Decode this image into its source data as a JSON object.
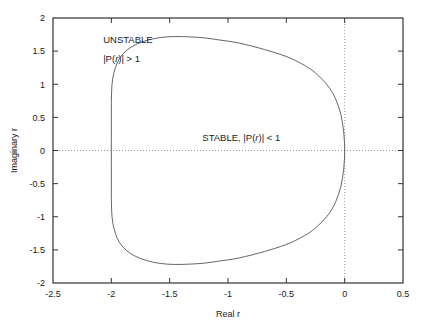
{
  "chart_data": {
    "type": "line",
    "title": "",
    "subtitle": "",
    "xlabel": "Real r",
    "ylabel": "Imaginary r",
    "xlim": [
      -2.5,
      0.5
    ],
    "ylim": [
      -2,
      2
    ],
    "xticks": [
      "-2.5",
      "-2",
      "-1.5",
      "-1",
      "-0.5",
      "0",
      "0.5"
    ],
    "xtick_values": [
      -2.5,
      -2,
      -1.5,
      -1,
      -0.5,
      0,
      0.5
    ],
    "yticks": [
      "-2",
      "-1.5",
      "-1",
      "-0.5",
      "0",
      "0.5",
      "1",
      "1.5",
      "2"
    ],
    "ytick_values": [
      -2,
      -1.5,
      -1,
      -0.5,
      0,
      0.5,
      1,
      1.5,
      2
    ],
    "grid": false,
    "legend": "none",
    "reference_lines": [
      {
        "name": "zero-imaginary-line",
        "orientation": "horizontal",
        "value": 0,
        "style": "dotted"
      },
      {
        "name": "zero-real-line",
        "orientation": "vertical",
        "value": 0,
        "style": "dotted"
      }
    ],
    "series": [
      {
        "name": "stability-boundary",
        "closed": true,
        "style": "solid",
        "color": "#555555",
        "description": "Closed contour where |P(r)| = 1",
        "extrema": {
          "left_real": -2.0,
          "right_real": 0.0,
          "top_imaginary": 1.72,
          "bottom_imaginary": -1.72
        },
        "points": [
          [
            0.0,
            0.0
          ],
          [
            -0.002,
            0.14
          ],
          [
            -0.008,
            0.28
          ],
          [
            -0.018,
            0.41
          ],
          [
            -0.032,
            0.54
          ],
          [
            -0.052,
            0.66
          ],
          [
            -0.078,
            0.78
          ],
          [
            -0.11,
            0.89
          ],
          [
            -0.15,
            0.99
          ],
          [
            -0.197,
            1.08
          ],
          [
            -0.25,
            1.17
          ],
          [
            -0.31,
            1.25
          ],
          [
            -0.38,
            1.32
          ],
          [
            -0.46,
            1.39
          ],
          [
            -0.55,
            1.45
          ],
          [
            -0.64,
            1.5
          ],
          [
            -0.74,
            1.55
          ],
          [
            -0.85,
            1.6
          ],
          [
            -0.96,
            1.64
          ],
          [
            -1.08,
            1.67
          ],
          [
            -1.2,
            1.7
          ],
          [
            -1.33,
            1.715
          ],
          [
            -1.46,
            1.72
          ],
          [
            -1.58,
            1.705
          ],
          [
            -1.69,
            1.665
          ],
          [
            -1.79,
            1.6
          ],
          [
            -1.87,
            1.51
          ],
          [
            -1.93,
            1.39
          ],
          [
            -1.965,
            1.25
          ],
          [
            -1.988,
            1.09
          ],
          [
            -1.997,
            0.92
          ],
          [
            -2.0,
            0.74
          ],
          [
            -2.0,
            0.55
          ],
          [
            -2.0,
            0.37
          ],
          [
            -2.0,
            0.18
          ],
          [
            -2.0,
            0.0
          ],
          [
            -2.0,
            -0.18
          ],
          [
            -2.0,
            -0.37
          ],
          [
            -2.0,
            -0.55
          ],
          [
            -2.0,
            -0.74
          ],
          [
            -1.997,
            -0.92
          ],
          [
            -1.988,
            -1.09
          ],
          [
            -1.965,
            -1.25
          ],
          [
            -1.93,
            -1.39
          ],
          [
            -1.87,
            -1.51
          ],
          [
            -1.79,
            -1.6
          ],
          [
            -1.69,
            -1.665
          ],
          [
            -1.58,
            -1.705
          ],
          [
            -1.46,
            -1.72
          ],
          [
            -1.33,
            -1.715
          ],
          [
            -1.2,
            -1.7
          ],
          [
            -1.08,
            -1.67
          ],
          [
            -0.96,
            -1.64
          ],
          [
            -0.85,
            -1.6
          ],
          [
            -0.74,
            -1.55
          ],
          [
            -0.64,
            -1.5
          ],
          [
            -0.55,
            -1.45
          ],
          [
            -0.46,
            -1.39
          ],
          [
            -0.38,
            -1.32
          ],
          [
            -0.31,
            -1.25
          ],
          [
            -0.25,
            -1.17
          ],
          [
            -0.197,
            -1.08
          ],
          [
            -0.15,
            -0.99
          ],
          [
            -0.11,
            -0.89
          ],
          [
            -0.078,
            -0.78
          ],
          [
            -0.052,
            -0.66
          ],
          [
            -0.032,
            -0.54
          ],
          [
            -0.018,
            -0.41
          ],
          [
            -0.008,
            -0.28
          ],
          [
            -0.002,
            -0.14
          ],
          [
            0.0,
            0.0
          ]
        ]
      }
    ],
    "annotations": [
      {
        "name": "unstable-label",
        "text": "UNSTABLE",
        "x": -2.07,
        "y": 1.62
      },
      {
        "name": "unstable-condition",
        "text_parts": [
          "|P(",
          "r",
          ")| > 1"
        ],
        "x": -2.07,
        "y": 1.33
      },
      {
        "name": "stable-label",
        "text_parts": [
          "STABLE,   |P(",
          "r",
          ")| < 1"
        ],
        "x": -1.22,
        "y": 0.15
      }
    ]
  },
  "axes": {
    "x_title": "Real r",
    "y_title": "Imaginary r"
  },
  "colors": {
    "curve": "#555555",
    "frame": "#333333",
    "dotted": "#999999",
    "text": "#1a1a1a",
    "background": "#ffffff"
  }
}
